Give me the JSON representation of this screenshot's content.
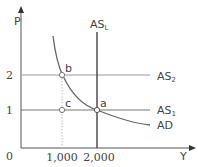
{
  "diagram": {
    "axes": {
      "y_label": "P",
      "x_label": "Y",
      "origin_label": "0",
      "y_ticks": [
        "2",
        "1"
      ],
      "x_ticks": [
        "1,000",
        "2,000"
      ]
    },
    "curves": {
      "as_long_run": {
        "main": "AS",
        "sub": "L"
      },
      "as_2": {
        "main": "AS",
        "sub": "2"
      },
      "as_1": {
        "main": "AS",
        "sub": "1"
      },
      "ad": "AD"
    },
    "points": {
      "a": "a",
      "b": "b",
      "c": "c"
    },
    "colors": {
      "axis": "#555555",
      "as_long_run": "#333333",
      "horizontal_lines": "#888888",
      "ad_curve": "#666666",
      "dotted_guide": "#bbbbbb"
    }
  }
}
